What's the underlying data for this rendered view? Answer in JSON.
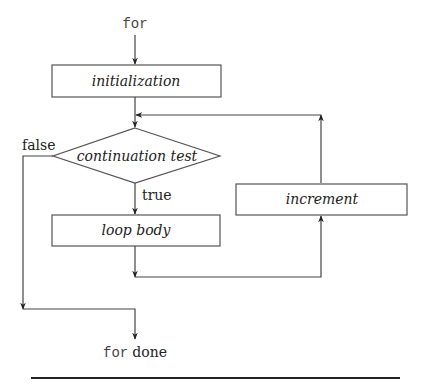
{
  "diagram": {
    "type": "flowchart",
    "start_keyword": "for",
    "nodes": {
      "initialization": {
        "label": "initialization",
        "shape": "rectangle"
      },
      "continuation_test": {
        "label": "continuation test",
        "shape": "diamond"
      },
      "loop_body": {
        "label": "loop body",
        "shape": "rectangle"
      },
      "increment": {
        "label": "increment",
        "shape": "rectangle"
      }
    },
    "edge_labels": {
      "false": "false",
      "true": "true"
    },
    "end": {
      "keyword": "for",
      "text": "done"
    },
    "edges": [
      {
        "from": "for",
        "to": "initialization"
      },
      {
        "from": "initialization",
        "to": "continuation_test"
      },
      {
        "from": "continuation_test",
        "to": "loop_body",
        "label": "true"
      },
      {
        "from": "continuation_test",
        "to": "for_done",
        "label": "false"
      },
      {
        "from": "loop_body",
        "to": "increment"
      },
      {
        "from": "increment",
        "to": "continuation_test"
      }
    ],
    "colors": {
      "line": "#444444",
      "box_border": "#555555",
      "text": "#222222"
    }
  }
}
